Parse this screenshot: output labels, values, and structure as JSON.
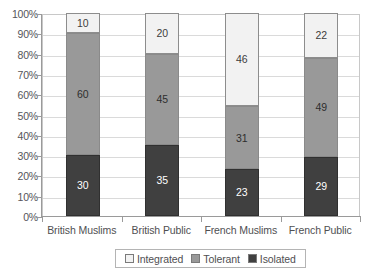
{
  "chart_data": {
    "type": "bar",
    "stacked": true,
    "stack_mode": "percent",
    "title": "",
    "subtitle": "",
    "xlabel": "",
    "ylabel": "",
    "ylim": [
      0,
      100
    ],
    "ytick_step": 10,
    "ytick_labels": [
      "0%",
      "10%",
      "20%",
      "30%",
      "40%",
      "50%",
      "60%",
      "70%",
      "80%",
      "90%",
      "100%"
    ],
    "ytick_values": [
      0,
      10,
      20,
      30,
      40,
      50,
      60,
      70,
      80,
      90,
      100
    ],
    "grid": true,
    "grid_axis": "y",
    "legend_position": "bottom",
    "categories": [
      "British Muslims",
      "British Public",
      "French Muslims",
      "French Public"
    ],
    "series": [
      {
        "name": "Isolated",
        "color": "#404040",
        "values": [
          30,
          35,
          23,
          29
        ],
        "stack_order": 0
      },
      {
        "name": "Tolerant",
        "color": "#999999",
        "values": [
          60,
          45,
          31,
          49
        ],
        "stack_order": 1
      },
      {
        "name": "Integrated",
        "color": "#f2f2f2",
        "values": [
          10,
          20,
          46,
          22
        ],
        "stack_order": 2
      }
    ]
  },
  "legend": {
    "items": [
      {
        "label": "Integrated",
        "color": "#f2f2f2"
      },
      {
        "label": "Tolerant",
        "color": "#999999"
      },
      {
        "label": "Isolated",
        "color": "#404040"
      }
    ]
  },
  "colors": {
    "integrated": "#f2f2f2",
    "tolerant": "#999999",
    "isolated": "#404040",
    "axis": "#9a9a9a",
    "grid": "#dadada",
    "plot_border": "#c8c8c8",
    "text": "#4f4f52",
    "background": "#ffffff"
  }
}
